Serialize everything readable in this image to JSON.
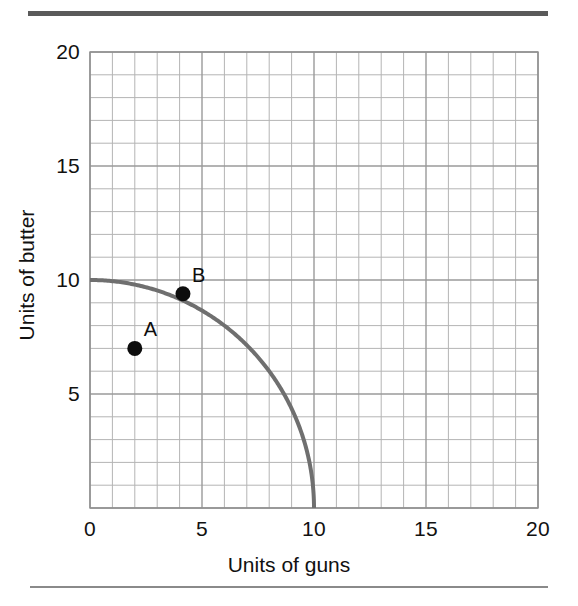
{
  "figure": {
    "kind": "production-possibility-frontier",
    "background_color": "#ffffff",
    "top_rule_color": "#5a5a5a",
    "bottom_rule_color": "#8a8a8a"
  },
  "chart_data": {
    "type": "line",
    "title": "",
    "subtitle": "",
    "xlabel": "Units of guns",
    "ylabel": "Units of butter",
    "xlim": [
      0,
      20
    ],
    "ylim": [
      0,
      20
    ],
    "xticks": [
      0,
      5,
      10,
      15,
      20
    ],
    "yticks": [
      5,
      10,
      15,
      20
    ],
    "xtick_labels": [
      "0",
      "5",
      "10",
      "15",
      "20"
    ],
    "ytick_labels": [
      "5",
      "10",
      "15",
      "20"
    ],
    "grid": true,
    "grid_minor_step": 1,
    "grid_major_step": 5,
    "grid_color": "#9a9a9a",
    "grid_minor_color": "#b4b4b4",
    "legend": null,
    "series": [
      {
        "name": "Production possibility frontier",
        "type": "curve",
        "shape": "quarter-circle",
        "color": "#6f6f6f",
        "linewidth": 4,
        "x_intercept": 10,
        "y_intercept": 10,
        "points": [
          {
            "x": 0.0,
            "y": 10.0
          },
          {
            "x": 1.0,
            "y": 9.95
          },
          {
            "x": 2.0,
            "y": 9.8
          },
          {
            "x": 3.0,
            "y": 9.54
          },
          {
            "x": 4.0,
            "y": 9.17
          },
          {
            "x": 5.0,
            "y": 8.66
          },
          {
            "x": 6.0,
            "y": 8.0
          },
          {
            "x": 7.0,
            "y": 7.14
          },
          {
            "x": 8.0,
            "y": 6.0
          },
          {
            "x": 9.0,
            "y": 4.36
          },
          {
            "x": 9.5,
            "y": 3.12
          },
          {
            "x": 10.0,
            "y": 0.0
          }
        ]
      }
    ],
    "annotations": [
      {
        "label": "A",
        "x": 2.0,
        "y": 7.0,
        "marker": "filled-circle",
        "marker_color": "#0d0d0d",
        "marker_size": 15,
        "label_position": "upper-right",
        "description": "inefficient point inside the frontier"
      },
      {
        "label": "B",
        "x": 4.15,
        "y": 9.4,
        "marker": "filled-circle",
        "marker_color": "#0d0d0d",
        "marker_size": 15,
        "label_position": "upper-right",
        "description": "efficient point on the frontier"
      }
    ]
  }
}
